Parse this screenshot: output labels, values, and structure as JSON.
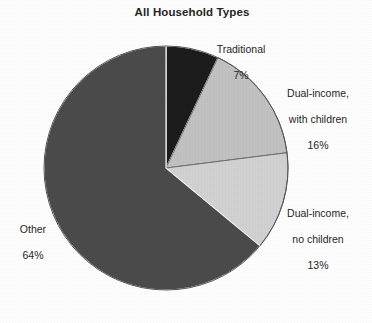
{
  "chart_data": {
    "type": "pie",
    "title": "All Household Types",
    "xlabel": "",
    "ylabel": "",
    "legend_position": "none",
    "grid": false,
    "units": "percent",
    "start_angle_deg": 90,
    "direction": "clockwise",
    "categories": [
      "Traditional",
      "Dual-income, with children",
      "Dual-income, no children",
      "Other"
    ],
    "values": [
      7,
      16,
      13,
      64
    ],
    "slices": [
      {
        "label_line1": "Traditional",
        "label_line2": "",
        "value": 7,
        "value_text": "7%",
        "color": "#1c1c1c"
      },
      {
        "label_line1": "Dual-income,",
        "label_line2": "with children",
        "value": 16,
        "value_text": "16%",
        "color": "#c2c2c2"
      },
      {
        "label_line1": "Dual-income,",
        "label_line2": "no children",
        "value": 13,
        "value_text": "13%",
        "color": "#d2d2d2"
      },
      {
        "label_line1": "Other",
        "label_line2": "",
        "value": 64,
        "value_text": "64%",
        "color": "#4b4b4b"
      }
    ]
  },
  "colors": {
    "background": "#ffffff",
    "text": "#1f1f1f",
    "title": "#262626",
    "outline": "#3a3a3a",
    "traditional": "#1c1c1c",
    "dual_income_with_children": "#c2c2c2",
    "dual_income_no_children": "#d2d2d2",
    "other": "#4b4b4b"
  }
}
